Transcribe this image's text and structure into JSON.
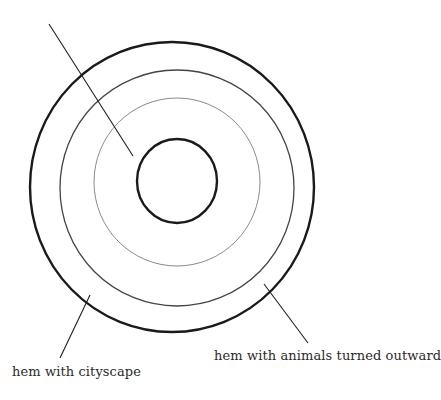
{
  "diagram": {
    "type": "concentric-circles",
    "background": "#ffffff",
    "circles": [
      {
        "id": "outer",
        "cx": 172,
        "cy": 187,
        "rx": 142,
        "ry": 145,
        "stroke": "#1a1a1a",
        "width": 2.4
      },
      {
        "id": "second",
        "cx": 177,
        "cy": 188,
        "rx": 117,
        "ry": 118,
        "stroke": "#444444",
        "width": 1.3
      },
      {
        "id": "third",
        "cx": 177,
        "cy": 182,
        "rx": 83,
        "ry": 84,
        "stroke": "#8a8a8a",
        "width": 1.0
      },
      {
        "id": "inner",
        "cx": 177,
        "cy": 181,
        "rx": 40,
        "ry": 42,
        "stroke": "#1a1a1a",
        "width": 2.4
      }
    ],
    "leaders": [
      {
        "id": "top-left",
        "x1": 49,
        "y1": 24,
        "x2": 133,
        "y2": 156
      },
      {
        "id": "bottom-left",
        "x1": 90,
        "y1": 295,
        "x2": 60,
        "y2": 358
      },
      {
        "id": "bottom-right",
        "x1": 264,
        "y1": 284,
        "x2": 308,
        "y2": 343
      }
    ]
  },
  "labels": {
    "animals": "hem with animals turned outward",
    "cityscape": "hem with cityscape"
  }
}
